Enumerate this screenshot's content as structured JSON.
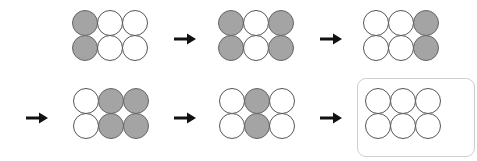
{
  "diagram": {
    "colors": {
      "filled": "#a4a4a4",
      "empty": "#ffffff",
      "stroke": "#555555",
      "arrow": "#111111",
      "highlight_border": "#cfcfcf"
    },
    "steps": [
      {
        "id": 1,
        "pattern": [
          [
            1,
            0,
            0
          ],
          [
            1,
            0,
            0
          ]
        ]
      },
      {
        "id": 2,
        "pattern": [
          [
            1,
            0,
            1
          ],
          [
            1,
            0,
            1
          ]
        ]
      },
      {
        "id": 3,
        "pattern": [
          [
            0,
            0,
            1
          ],
          [
            0,
            0,
            1
          ]
        ]
      },
      {
        "id": 4,
        "pattern": [
          [
            0,
            1,
            1
          ],
          [
            0,
            1,
            1
          ]
        ]
      },
      {
        "id": 5,
        "pattern": [
          [
            0,
            1,
            0
          ],
          [
            0,
            1,
            0
          ]
        ]
      },
      {
        "id": 6,
        "pattern": [
          [
            0,
            0,
            0
          ],
          [
            0,
            0,
            0
          ]
        ],
        "highlighted": true
      }
    ],
    "arrows": 5
  }
}
